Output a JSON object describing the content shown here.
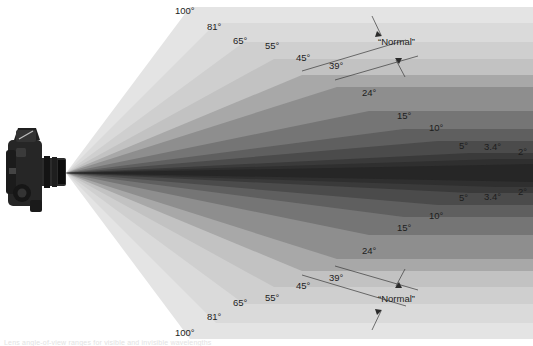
{
  "figure": {
    "apex": {
      "x": 66,
      "y": 173
    },
    "center_y": 173,
    "camera": {
      "name": "slr-camera-top-view",
      "x": 2,
      "y": 133,
      "width": 62,
      "height": 80
    },
    "normal_bracket": {
      "label": "“Normal”",
      "top": {
        "label_x": 378,
        "label_y": 45
      },
      "bottom": {
        "label_x": 378,
        "label_y": 302
      }
    },
    "caption_text": "Lens angle-of-view ranges for visible and invisible wavelengths"
  },
  "chart_data": {
    "type": "area",
    "xlabel": "",
    "ylabel": "",
    "units": "degrees",
    "legend_position": "none",
    "grid": false,
    "categories": [
      "100°",
      "81°",
      "65°",
      "55°",
      "45°",
      "39°",
      "24°",
      "15°",
      "10°",
      "5°",
      "3.4°",
      "2°"
    ],
    "values": [
      100,
      81,
      65,
      55,
      45,
      39,
      24,
      15,
      10,
      5,
      3.4,
      2
    ],
    "normal_lens_angles": [
      "45°",
      "39°"
    ],
    "wedges": [
      {
        "label": "100°",
        "value": 100,
        "tip_x": 190,
        "half_height": 166,
        "color": "#e4e4e4",
        "label_x": 175,
        "label_y": 14
      },
      {
        "label": "81°",
        "value": 81,
        "tip_x": 216,
        "half_height": 150,
        "color": "#dadada",
        "label_x": 207,
        "label_y": 30
      },
      {
        "label": "65°",
        "value": 65,
        "tip_x": 244,
        "half_height": 131,
        "color": "#cfcfcf",
        "label_x": 233,
        "label_y": 44
      },
      {
        "label": "55°",
        "value": 55,
        "tip_x": 274,
        "half_height": 114,
        "color": "#c2c2c2",
        "label_x": 265,
        "label_y": 49
      },
      {
        "label": "45°",
        "value": 45,
        "tip_x": 302,
        "half_height": 98,
        "color": "#a8a8a8",
        "label_x": 296,
        "label_y": 61
      },
      {
        "label": "39°",
        "value": 39,
        "tip_x": 337,
        "half_height": 86,
        "color": "#8e8e8e",
        "label_x": 329,
        "label_y": 69
      },
      {
        "label": "24°",
        "value": 24,
        "tip_x": 369,
        "half_height": 62,
        "color": "#757575",
        "label_x": 362,
        "label_y": 96
      },
      {
        "label": "15°",
        "value": 15,
        "tip_x": 404,
        "half_height": 44,
        "color": "#5f5f5f",
        "label_x": 397,
        "label_y": 119
      },
      {
        "label": "10°",
        "value": 10,
        "tip_x": 438,
        "half_height": 32,
        "color": "#4b4b4b",
        "label_x": 429,
        "label_y": 131
      },
      {
        "label": "5°",
        "value": 5,
        "tip_x": 470,
        "half_height": 20,
        "color": "#3a3a3a",
        "label_x": 459,
        "label_y": 149
      },
      {
        "label": "3.4°",
        "value": 3.4,
        "tip_x": 497,
        "half_height": 14,
        "color": "#2f2f2f",
        "label_x": 484,
        "label_y": 150
      },
      {
        "label": "2°",
        "value": 2,
        "tip_x": 533,
        "half_height": 9,
        "color": "#262626",
        "label_x": 518,
        "label_y": 155
      }
    ]
  }
}
